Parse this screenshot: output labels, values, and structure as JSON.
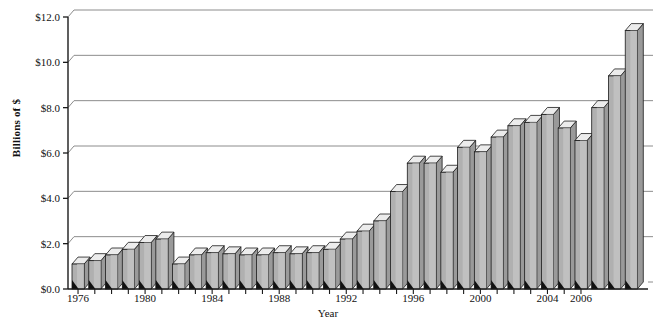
{
  "chart_data": {
    "type": "bar",
    "title": "",
    "subtitle": "",
    "xlabel": "Year",
    "ylabel": "Billions of $",
    "ylim": [
      0.0,
      12.0
    ],
    "y_ticks": [
      "$0.0",
      "$2.0",
      "$4.0",
      "$6.0",
      "$8.0",
      "$10.0",
      "$12.0"
    ],
    "y_tick_values": [
      0.0,
      2.0,
      4.0,
      6.0,
      8.0,
      10.0,
      12.0
    ],
    "x_tick_labels": [
      "1976",
      "1980",
      "1984",
      "1988",
      "1992",
      "1996",
      "2000",
      "2004",
      "2006"
    ],
    "grid": "horizontal",
    "legend": "none",
    "style": "3d-column",
    "categories": [
      "1976",
      "1977",
      "1978",
      "1979",
      "1980",
      "1981",
      "1982",
      "1983",
      "1984",
      "1985",
      "1986",
      "1987",
      "1988",
      "1989",
      "1990",
      "1991",
      "1992",
      "1993",
      "1994",
      "1995",
      "1996",
      "1997",
      "1998",
      "1999",
      "2000",
      "2001",
      "2002",
      "2003",
      "2004",
      "2005",
      "2006"
    ],
    "values": [
      1.1,
      1.25,
      1.5,
      1.75,
      2.05,
      2.2,
      1.1,
      1.5,
      1.6,
      1.55,
      1.5,
      1.5,
      1.6,
      1.55,
      1.6,
      1.75,
      2.2,
      2.55,
      3.0,
      4.3,
      5.55,
      5.55,
      5.15,
      6.25,
      6.05,
      6.7,
      7.2,
      7.35,
      7.7,
      7.1,
      6.55
    ],
    "values_tail": [
      8.0,
      9.4,
      11.4
    ],
    "colors": {
      "bar_front": "#b0b0b0",
      "bar_top": "#ececec",
      "bar_side": "#9a9a9a",
      "bar_outline": "#1a1a1a",
      "grid": "#8c8c8c",
      "axis": "#1a1a1a",
      "background": "#ffffff"
    }
  },
  "chart_note": {
    "bar_count": 31,
    "depth_px": 6
  }
}
